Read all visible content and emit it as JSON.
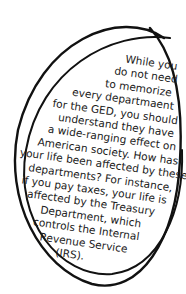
{
  "note": {
    "lines": [
      "While you",
      "do not need",
      "to memorize",
      "every departmaent",
      "for the GED, you should",
      "understand they have",
      "a wide-ranging effect on",
      "American society. How has",
      "your life been affected by these",
      "departments? For instance,",
      "if you pay taxes, your life is",
      "affected by the Treasury",
      "Department, which",
      "controls the Internal",
      "Revenue Service",
      "(IRS)."
    ]
  },
  "colors": {
    "ink": "#1a1a1a",
    "background": "#ffffff"
  }
}
